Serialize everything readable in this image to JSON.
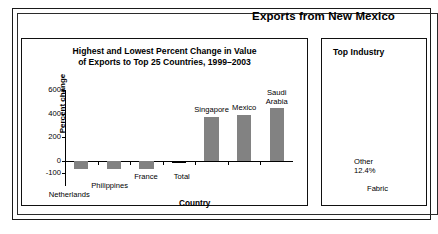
{
  "header": {
    "title": "Exports from New Mexico"
  },
  "chart_panel": {
    "title_line1": "Highest and Lowest Percent Change in Value",
    "title_line2": "of Exports to Top 25 Countries, 1999–2003"
  },
  "industry_panel": {
    "title": "Top Industry",
    "other_label": "Other",
    "other_value": "12.4%",
    "fabricated_label": "Fabric"
  },
  "chart_data": {
    "type": "bar",
    "title": "Highest and Lowest Percent Change in Value of Exports to Top 25 Countries, 1999–2003",
    "xlabel": "Country",
    "ylabel": "Percent change",
    "categories": [
      "Netherlands",
      "Philippines",
      "France",
      "Total",
      "Singapore",
      "Mexico",
      "Saudi Arabia"
    ],
    "values": [
      -70,
      -70,
      -70,
      -15,
      375,
      390,
      445
    ],
    "ylim": [
      -100,
      600
    ],
    "yticks": [
      600,
      400,
      200,
      0,
      -100
    ],
    "ytick_labels": [
      "600",
      "400",
      "200",
      "0",
      "-100"
    ],
    "grid": false,
    "legend": "none",
    "bar_colors": [
      "#828282",
      "#828282",
      "#828282",
      "#000000",
      "#828282",
      "#828282",
      "#828282"
    ],
    "label_placement": [
      "below-axis",
      "below-axis",
      "below-axis",
      "below-axis",
      "above-bar",
      "above-bar",
      "above-bar"
    ],
    "accent_color": "#828282",
    "total_color": "#000000"
  }
}
